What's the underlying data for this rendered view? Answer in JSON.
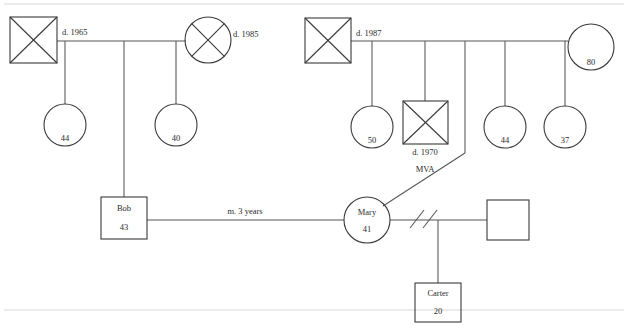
{
  "diagram": {
    "kind": "genogram",
    "background_color": "#ffffff",
    "stroke_color": "#3a3a3a",
    "link_color": "#555555"
  },
  "persons": {
    "paternal_grandfather": {
      "label": "",
      "shape": "square",
      "deceased": true,
      "annotation": "d. 1965"
    },
    "paternal_grandmother": {
      "label": "",
      "shape": "circle",
      "deceased": true,
      "annotation": "d. 1985"
    },
    "paternal_sibling_1": {
      "label": "44",
      "shape": "circle",
      "deceased": false
    },
    "paternal_sibling_2": {
      "label": "40",
      "shape": "circle",
      "deceased": false
    },
    "bob": {
      "name": "Bob",
      "age": "43",
      "shape": "square",
      "deceased": false
    },
    "maternal_grandfather": {
      "label": "",
      "shape": "square",
      "deceased": true,
      "annotation": "d. 1987"
    },
    "maternal_grandmother": {
      "label": "80",
      "shape": "circle",
      "deceased": false
    },
    "maternal_sibling_1": {
      "label": "50",
      "shape": "circle",
      "deceased": false
    },
    "maternal_sibling_2": {
      "label": "",
      "shape": "square",
      "deceased": true,
      "annotation": "d. 1970",
      "cause": "MVA"
    },
    "maternal_sibling_3": {
      "label": "44",
      "shape": "circle",
      "deceased": false
    },
    "maternal_sibling_4": {
      "label": "37",
      "shape": "circle",
      "deceased": false
    },
    "mary": {
      "name": "Mary",
      "age": "41",
      "shape": "circle",
      "deceased": false
    },
    "new_partner": {
      "label": "",
      "shape": "square",
      "deceased": false
    },
    "carter": {
      "name": "Carter",
      "age": "20",
      "shape": "square",
      "deceased": false
    }
  },
  "relationships": {
    "bob_mary_marriage": "m. 3 years",
    "mary_partner_status": "divorced"
  },
  "labels": {
    "d1965": "d. 1965",
    "d1985": "d. 1985",
    "d1987": "d. 1987",
    "d1970": "d. 1970",
    "mva": "MVA",
    "marriage_duration": "m. 3 years",
    "sib_44_left": "44",
    "sib_40_left": "40",
    "bob_name": "Bob",
    "bob_age": "43",
    "gm_age_80": "80",
    "sib_50": "50",
    "sib_44_right": "44",
    "sib_37": "37",
    "mary_name": "Mary",
    "mary_age": "41",
    "carter_name": "Carter",
    "carter_age": "20"
  }
}
